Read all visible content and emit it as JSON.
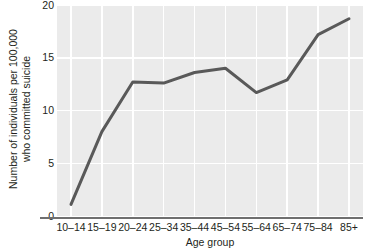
{
  "chart_data": {
    "type": "line",
    "title": "",
    "subtitle": "",
    "xlabel": "Age group",
    "ylabel": "Number of individuals per 100,000 who committed suicide",
    "ylabel_line1": "Number of individuals per 100,000",
    "ylabel_line2": "who committed suicide",
    "categories": [
      "10–14",
      "15–19",
      "20–24",
      "25–34",
      "35–44",
      "45–54",
      "55–64",
      "65–74",
      "75–84",
      "85+"
    ],
    "values": [
      1.1,
      8.0,
      12.7,
      12.6,
      13.6,
      14.0,
      11.7,
      12.9,
      17.2,
      18.7
    ],
    "ylim": [
      0,
      20
    ],
    "yticks": [
      0,
      5,
      10,
      15,
      20
    ],
    "ytick_labels": [
      "0",
      "5",
      "10",
      "15",
      "20"
    ],
    "grid": true,
    "grid_color": "#ffffff",
    "legend": "none",
    "line_color": "#595959",
    "line_width": 3,
    "plot_background": "#ebebeb",
    "axis_color": "#6f6f6f",
    "text_color": "#231f20",
    "markers": "none",
    "annotations": []
  }
}
